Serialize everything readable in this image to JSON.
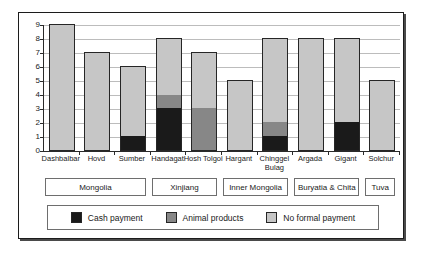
{
  "chart_data": {
    "type": "bar",
    "stacked": true,
    "title": "",
    "xlabel": "",
    "ylabel": "",
    "ylim": [
      0,
      9
    ],
    "yticks": [
      0,
      1,
      2,
      3,
      4,
      5,
      6,
      7,
      8,
      9
    ],
    "grid": true,
    "legend_position": "bottom",
    "categories": [
      "Dashbalbar",
      "Hovd",
      "Sumber",
      "Handagat",
      "Hosh Tolgoi",
      "Hargant",
      "Chinggel Bulag",
      "Argada",
      "Gigant",
      "Solchur"
    ],
    "series": [
      {
        "name": "Cash payment",
        "color": "#1a1a1a",
        "values": [
          0,
          0,
          1,
          3,
          0,
          0,
          1,
          0,
          2,
          0
        ]
      },
      {
        "name": "Animal products",
        "color": "#878787",
        "values": [
          0,
          0,
          0,
          1,
          3,
          0,
          1,
          0,
          0,
          0
        ]
      },
      {
        "name": "No formal payment",
        "color": "#c6c6c6",
        "values": [
          9,
          7,
          5,
          4,
          4,
          5,
          6,
          8,
          6,
          5
        ]
      }
    ],
    "totals": [
      9,
      7,
      6,
      8,
      7,
      5,
      8,
      8,
      8,
      5
    ],
    "groups": [
      {
        "label": "Mongolia",
        "start": 0,
        "count": 3
      },
      {
        "label": "Xinjiang",
        "start": 3,
        "count": 2
      },
      {
        "label": "Inner Mongolia",
        "start": 5,
        "count": 2
      },
      {
        "label": "Buryatia & Chita",
        "start": 7,
        "count": 2
      },
      {
        "label": "Tuva",
        "start": 9,
        "count": 1
      }
    ],
    "gridline_color": "#bcbcbc"
  }
}
